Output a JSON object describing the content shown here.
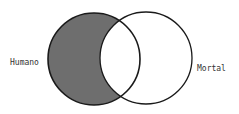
{
  "diagram": {
    "type": "venn",
    "sets": [
      {
        "id": "humano",
        "label": "Humano",
        "shaded_region": "humano-only"
      },
      {
        "id": "mortal",
        "label": "Mortal"
      }
    ],
    "shading": {
      "region": "Humano minus Mortal",
      "color": "#6e6e6e"
    },
    "colors": {
      "outline": "#1a1a1a",
      "background": "#ffffff"
    }
  }
}
